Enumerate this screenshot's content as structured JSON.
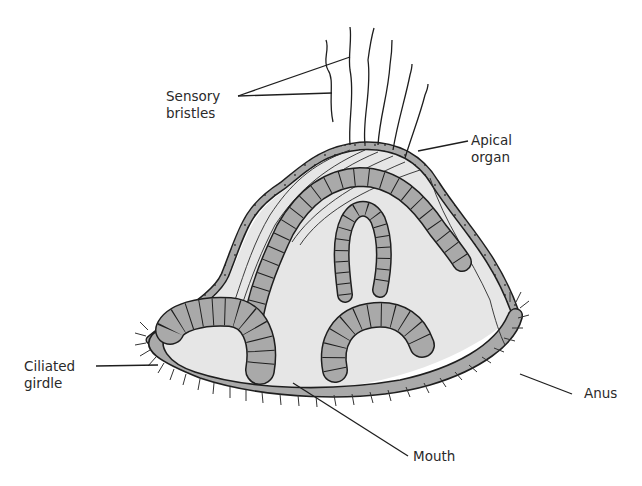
{
  "figure": {
    "colors": {
      "background": "#ffffff",
      "body_fill": "#e6e6e6",
      "epithelium_fill": "#a9a9a9",
      "outline": "#1e1e1e",
      "label_text": "#2a2a2a"
    }
  },
  "labels": {
    "sensory_bristles": "Sensory\nbristles",
    "apical_organ": "Apical\norgan",
    "ciliated_girdle": "Ciliated\ngirdle",
    "anus": "Anus",
    "mouth": "Mouth"
  }
}
